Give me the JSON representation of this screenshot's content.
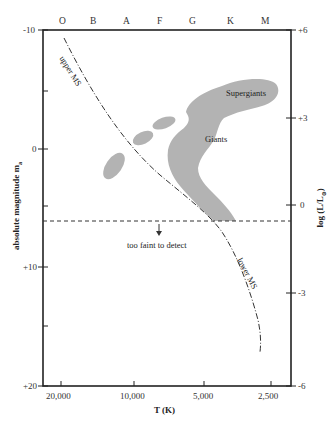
{
  "diagram": {
    "spectral_classes": [
      "O",
      "B",
      "A",
      "F",
      "G",
      "K",
      "M"
    ],
    "left_axis": {
      "title": "absolute magnitude m",
      "title_subscript": "a",
      "ticks": [
        "-10",
        "0",
        "+10",
        "+20"
      ]
    },
    "right_axis": {
      "title": "log (L/L",
      "title_subscript": "⊙",
      "title_close": ")",
      "ticks": [
        "+6",
        "+3",
        "0",
        "-3",
        "-6"
      ]
    },
    "bottom_axis": {
      "title": "T (K)",
      "ticks": [
        "20,000",
        "10,000",
        "5,000",
        "2,500"
      ]
    },
    "regions": {
      "supergiants": "Supergiants",
      "giants": "Giants",
      "upper_ms": "upper MS",
      "lower_ms": "lower MS",
      "detection_limit": "too faint to detect"
    },
    "colors": {
      "region_fill": "#b3b3b3",
      "axis": "#222222",
      "curve": "#333333"
    }
  }
}
